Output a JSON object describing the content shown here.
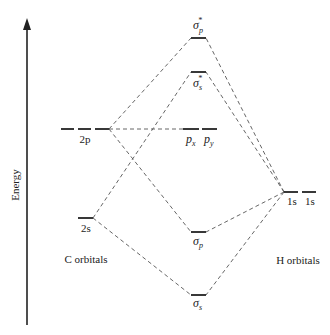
{
  "diagram": {
    "type": "molecular-orbital-diagram",
    "axis": {
      "label": "Energy",
      "direction": "up"
    },
    "groups": {
      "left": {
        "label": "C orbitals"
      },
      "right": {
        "label": "H orbitals"
      }
    },
    "atomic_orbitals": {
      "c_2p": {
        "label": "2p",
        "count": 3
      },
      "c_2s": {
        "label": "2s",
        "count": 1
      },
      "h_1s": {
        "labels": [
          "1s",
          "1s"
        ],
        "count": 2
      }
    },
    "molecular_orbitals": {
      "sigma_p_star": {
        "symbol": "σ",
        "sub": "p",
        "sup": "*"
      },
      "sigma_s_star": {
        "symbol": "σ",
        "sub": "s",
        "sup": "*"
      },
      "nonbonding": {
        "labels": [
          {
            "symbol": "p",
            "sub": "x"
          },
          {
            "symbol": "p",
            "sub": "y"
          }
        ]
      },
      "sigma_p": {
        "symbol": "σ",
        "sub": "p"
      },
      "sigma_s": {
        "symbol": "σ",
        "sub": "s"
      }
    },
    "connections": [
      {
        "from": "c_2p",
        "to": "sigma_p_star"
      },
      {
        "from": "c_2p",
        "to": "sigma_p"
      },
      {
        "from": "c_2p",
        "to": "nonbonding"
      },
      {
        "from": "c_2s",
        "to": "sigma_s_star"
      },
      {
        "from": "c_2s",
        "to": "sigma_s"
      },
      {
        "from": "h_1s",
        "to": "sigma_p_star"
      },
      {
        "from": "h_1s",
        "to": "sigma_s_star"
      },
      {
        "from": "h_1s",
        "to": "sigma_p"
      },
      {
        "from": "h_1s",
        "to": "sigma_s"
      }
    ]
  }
}
